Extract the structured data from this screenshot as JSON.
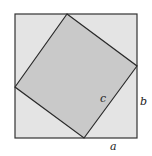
{
  "diagram": {
    "title": "",
    "outer_square": {
      "x": 15,
      "y": 14,
      "width": 122,
      "height": 124,
      "fill": "#e4e4e4",
      "stroke": "#333333"
    },
    "inner_square": {
      "points": [
        [
          67,
          14
        ],
        [
          137,
          66
        ],
        [
          84,
          138
        ],
        [
          15,
          87
        ]
      ],
      "fill": "#c9c9c9",
      "stroke": "#2a2a2a"
    },
    "labels": {
      "c": "c",
      "b": "b",
      "a": "a"
    }
  }
}
